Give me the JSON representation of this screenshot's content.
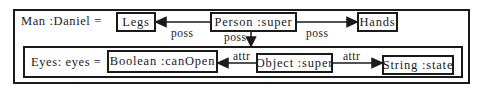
{
  "diagram": {
    "outer_frame": {
      "label": "Man :Daniel ="
    },
    "inner_frame": {
      "label": "Eyes: eyes ="
    },
    "nodes": {
      "legs": {
        "label": "Legs"
      },
      "person": {
        "label": "Person :super"
      },
      "hands": {
        "label": "Hands"
      },
      "boolean": {
        "label": "Boolean :canOpen"
      },
      "object": {
        "label": "Object :super"
      },
      "string": {
        "label": "String :state"
      }
    },
    "edges": [
      {
        "from": "Person :super",
        "to": "Legs",
        "label": "poss"
      },
      {
        "from": "Person :super",
        "to": "Hands",
        "label": "poss"
      },
      {
        "from": "Person :super",
        "to": "Eyes: eyes",
        "label": "poss"
      },
      {
        "from": "Object :super",
        "to": "Boolean :canOpen",
        "label": "attr"
      },
      {
        "from": "Object :super",
        "to": "String :state",
        "label": "attr"
      }
    ],
    "colors": {
      "stroke": "#1a1a1a",
      "background": "#ffffff"
    }
  }
}
